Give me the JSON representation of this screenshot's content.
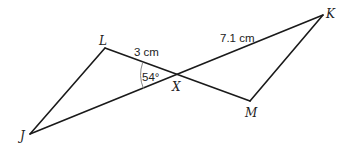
{
  "diagram": {
    "vertices": {
      "J": {
        "label": "J",
        "x": 30,
        "y": 134
      },
      "L": {
        "label": "L",
        "x": 105,
        "y": 48
      },
      "X": {
        "label": "X",
        "x": 177,
        "y": 75
      },
      "M": {
        "label": "M",
        "x": 250,
        "y": 101
      },
      "K": {
        "label": "K",
        "x": 323,
        "y": 15
      }
    },
    "measurements": {
      "LX": "3 cm",
      "XK": "7.1 cm",
      "angle_LXJ": "54°"
    }
  }
}
